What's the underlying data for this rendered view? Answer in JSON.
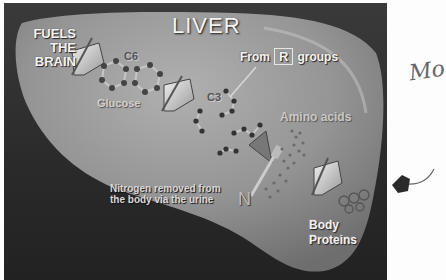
{
  "slide": {
    "title": "LIVER",
    "fuels_label": [
      "FUELS",
      "THE",
      "BRAIN"
    ],
    "glucose_formula": "C6",
    "glucose_label": "Glucose",
    "pyruvate_formula": "C3",
    "r_groups": {
      "prefix": "From",
      "symbol": "R",
      "suffix": "groups"
    },
    "amino_label": "Amino acids",
    "nitrogen_note": [
      "Nitrogen removed from",
      "the body via the urine"
    ],
    "nitrogen_symbol": "N",
    "proteins_label": [
      "Body",
      "Proteins"
    ]
  },
  "annotations": {
    "handwriting_text": "Mo",
    "handwriting_arrow": "hand-drawn arrow pointing left to Body Proteins"
  },
  "colors": {
    "page_bg": "#fdfdfd",
    "slide_bg": "#2c2c2c",
    "liver_fill": "#8f8f8f",
    "text": "#f2f2f2"
  }
}
